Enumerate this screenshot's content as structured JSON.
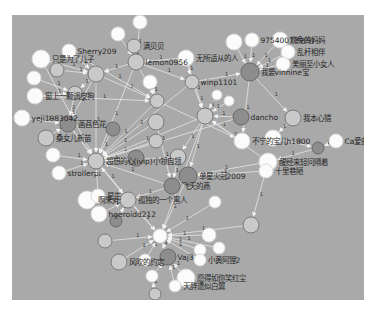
{
  "graph": {
    "type": "directed-network",
    "background": "#a9a9a9",
    "edge_color": "#e8e8e8",
    "node_colors": {
      "light": "#ffffff",
      "mid": "#c8c8c8",
      "dark": "#8c8c8c"
    },
    "nodes": [
      {
        "id": "n1",
        "x": 140,
        "y": 22,
        "r": 7,
        "tone": "light",
        "label": ""
      },
      {
        "id": "n2",
        "x": 118,
        "y": 34,
        "r": 7,
        "tone": "light",
        "label": ""
      },
      {
        "id": "n3",
        "x": 134,
        "y": 46,
        "r": 7,
        "tone": "mid",
        "label": "满贝贝"
      },
      {
        "id": "n4",
        "x": 69,
        "y": 51,
        "r": 7,
        "tone": "light",
        "label": "Sherry209"
      },
      {
        "id": "n5",
        "x": 41,
        "y": 59,
        "r": 9,
        "tone": "light",
        "label": "只是为了儿子"
      },
      {
        "id": "n6",
        "x": 57,
        "y": 70,
        "r": 7,
        "tone": "mid",
        "label": ""
      },
      {
        "id": "n7",
        "x": 96,
        "y": 74,
        "r": 8,
        "tone": "mid",
        "label": ""
      },
      {
        "id": "n8",
        "x": 136,
        "y": 62,
        "r": 8,
        "tone": "mid",
        "label": "lemon0956"
      },
      {
        "id": "n9",
        "x": 186,
        "y": 58,
        "r": 8,
        "tone": "light",
        "label": "无所适从的人"
      },
      {
        "id": "n10",
        "x": 34,
        "y": 78,
        "r": 7,
        "tone": "light",
        "label": ""
      },
      {
        "id": "n11",
        "x": 75,
        "y": 93,
        "r": 7,
        "tone": "mid",
        "label": ""
      },
      {
        "id": "n12",
        "x": 35,
        "y": 96,
        "r": 8,
        "tone": "light",
        "label": "窗上一颗调皮狗"
      },
      {
        "id": "n13",
        "x": 150,
        "y": 82,
        "r": 7,
        "tone": "light",
        "label": ""
      },
      {
        "id": "n14",
        "x": 157,
        "y": 101,
        "r": 7,
        "tone": "mid",
        "label": ""
      },
      {
        "id": "n15",
        "x": 22,
        "y": 118,
        "r": 8,
        "tone": "light",
        "label": "yeji1983042"
      },
      {
        "id": "n16",
        "x": 68,
        "y": 124,
        "r": 8,
        "tone": "dark",
        "label": "菡萏色花"
      },
      {
        "id": "n17",
        "x": 113,
        "y": 129,
        "r": 7,
        "tone": "dark",
        "label": ""
      },
      {
        "id": "n18",
        "x": 46,
        "y": 138,
        "r": 8,
        "tone": "mid",
        "label": "桑女儿新苗"
      },
      {
        "id": "n19",
        "x": 156,
        "y": 122,
        "r": 8,
        "tone": "mid",
        "label": ""
      },
      {
        "id": "n20",
        "x": 156,
        "y": 141,
        "r": 7,
        "tone": "mid",
        "label": ""
      },
      {
        "id": "n21",
        "x": 53,
        "y": 155,
        "r": 7,
        "tone": "light",
        "label": ""
      },
      {
        "id": "n22",
        "x": 96,
        "y": 161,
        "r": 8,
        "tone": "mid",
        "label": "超想的心(ivip)小领自领"
      },
      {
        "id": "n23",
        "x": 136,
        "y": 158,
        "r": 8,
        "tone": "dark",
        "label": ""
      },
      {
        "id": "n24",
        "x": 178,
        "y": 157,
        "r": 8,
        "tone": "mid",
        "label": ""
      },
      {
        "id": "n25",
        "x": 59,
        "y": 173,
        "r": 7,
        "tone": "light",
        "label": "strollerp"
      },
      {
        "id": "n26",
        "x": 192,
        "y": 82,
        "r": 7,
        "tone": "mid",
        "label": "winp1101"
      },
      {
        "id": "n27",
        "x": 217,
        "y": 95,
        "r": 5,
        "tone": "light",
        "label": ""
      },
      {
        "id": "n28",
        "x": 229,
        "y": 101,
        "r": 5,
        "tone": "light",
        "label": ""
      },
      {
        "id": "n29",
        "x": 234,
        "y": 42,
        "r": 8,
        "tone": "light",
        "label": ""
      },
      {
        "id": "n30",
        "x": 252,
        "y": 40,
        "r": 7,
        "tone": "light",
        "label": "975400739(9)"
      },
      {
        "id": "n31",
        "x": 280,
        "y": 40,
        "r": 8,
        "tone": "light",
        "label": "烧免的妈妈"
      },
      {
        "id": "n32",
        "x": 288,
        "y": 52,
        "r": 7,
        "tone": "light",
        "label": "乱杆相伴"
      },
      {
        "id": "n33",
        "x": 283,
        "y": 64,
        "r": 7,
        "tone": "light",
        "label": "美丽至小女人"
      },
      {
        "id": "n34",
        "x": 250,
        "y": 72,
        "r": 9,
        "tone": "dark",
        "label": "我要vinnine宝"
      },
      {
        "id": "n35",
        "x": 205,
        "y": 116,
        "r": 8,
        "tone": "mid",
        "label": ""
      },
      {
        "id": "n36",
        "x": 241,
        "y": 117,
        "r": 8,
        "tone": "dark",
        "label": "dancho"
      },
      {
        "id": "n37",
        "x": 293,
        "y": 118,
        "r": 8,
        "tone": "mid",
        "label": "我本心猎"
      },
      {
        "id": "n38",
        "x": 242,
        "y": 141,
        "r": 8,
        "tone": "light",
        "label": "不宁的宝儿h1800"
      },
      {
        "id": "n39",
        "x": 273,
        "y": 138,
        "r": 8,
        "tone": "light",
        "label": ""
      },
      {
        "id": "n40",
        "x": 318,
        "y": 148,
        "r": 6,
        "tone": "dark",
        "label": ""
      },
      {
        "id": "n41",
        "x": 336,
        "y": 141,
        "r": 7,
        "tone": "light",
        "label": "Ca爱曲"
      },
      {
        "id": "n42",
        "x": 268,
        "y": 162,
        "r": 9,
        "tone": "light",
        "label": "醒经来轻问隔着"
      },
      {
        "id": "n43",
        "x": 266,
        "y": 171,
        "r": 7,
        "tone": "light",
        "label": "十里巷陋"
      },
      {
        "id": "n44",
        "x": 188,
        "y": 176,
        "r": 9,
        "tone": "dark",
        "label": "单星火冠2009"
      },
      {
        "id": "n45",
        "x": 172,
        "y": 186,
        "r": 8,
        "tone": "dark",
        "label": "飞天的燕"
      },
      {
        "id": "n46",
        "x": 215,
        "y": 202,
        "r": 6,
        "tone": "light",
        "label": ""
      },
      {
        "id": "n47",
        "x": 87,
        "y": 200,
        "r": 9,
        "tone": "light",
        "label": "啊朱丸"
      },
      {
        "id": "n48",
        "x": 98,
        "y": 196,
        "r": 7,
        "tone": "light",
        "label": "星生"
      },
      {
        "id": "n49",
        "x": 128,
        "y": 200,
        "r": 8,
        "tone": "mid",
        "label": "孤独的一个黑人"
      },
      {
        "id": "n50",
        "x": 99,
        "y": 214,
        "r": 8,
        "tone": "light",
        "label": "hgeroidd212"
      },
      {
        "id": "n51",
        "x": 116,
        "y": 221,
        "r": 6,
        "tone": "dark",
        "label": ""
      },
      {
        "id": "n52",
        "x": 160,
        "y": 236,
        "r": 7,
        "tone": "light",
        "label": ""
      },
      {
        "id": "n53",
        "x": 251,
        "y": 225,
        "r": 8,
        "tone": "mid",
        "label": ""
      },
      {
        "id": "n54",
        "x": 105,
        "y": 241,
        "r": 7,
        "tone": "mid",
        "label": ""
      },
      {
        "id": "n55",
        "x": 209,
        "y": 235,
        "r": 7,
        "tone": "light",
        "label": ""
      },
      {
        "id": "n56",
        "x": 219,
        "y": 248,
        "r": 6,
        "tone": "light",
        "label": ""
      },
      {
        "id": "n57",
        "x": 200,
        "y": 250,
        "r": 6,
        "tone": "light",
        "label": ""
      },
      {
        "id": "n58",
        "x": 119,
        "y": 262,
        "r": 8,
        "tone": "mid",
        "label": "风吹的约定"
      },
      {
        "id": "n59",
        "x": 145,
        "y": 260,
        "r": 6,
        "tone": "light",
        "label": ""
      },
      {
        "id": "n60",
        "x": 168,
        "y": 257,
        "r": 8,
        "tone": "dark",
        "label": "Vaj3"
      },
      {
        "id": "n61",
        "x": 200,
        "y": 260,
        "r": 6,
        "tone": "light",
        "label": "小黄阿狸2"
      },
      {
        "id": "n62",
        "x": 152,
        "y": 276,
        "r": 6,
        "tone": "light",
        "label": ""
      },
      {
        "id": "n63",
        "x": 186,
        "y": 278,
        "r": 9,
        "tone": "light",
        "label": "愿得如你笑红尘"
      },
      {
        "id": "n64",
        "x": 175,
        "y": 286,
        "r": 6,
        "tone": "light",
        "label": "天辞遗似白翼"
      },
      {
        "id": "n65",
        "x": 155,
        "y": 294,
        "r": 6,
        "tone": "mid",
        "label": ""
      }
    ],
    "edges": [
      [
        "n1",
        "n8"
      ],
      [
        "n2",
        "n8"
      ],
      [
        "n3",
        "n8"
      ],
      [
        "n4",
        "n7"
      ],
      [
        "n5",
        "n7"
      ],
      [
        "n6",
        "n7"
      ],
      [
        "n8",
        "n7"
      ],
      [
        "n9",
        "n8"
      ],
      [
        "n10",
        "n11"
      ],
      [
        "n12",
        "n11"
      ],
      [
        "n7",
        "n11"
      ],
      [
        "n7",
        "n16"
      ],
      [
        "n11",
        "n16"
      ],
      [
        "n15",
        "n16"
      ],
      [
        "n18",
        "n16"
      ],
      [
        "n13",
        "n14"
      ],
      [
        "n8",
        "n14"
      ],
      [
        "n7",
        "n14"
      ],
      [
        "n14",
        "n22"
      ],
      [
        "n16",
        "n22"
      ],
      [
        "n21",
        "n22"
      ],
      [
        "n25",
        "n22"
      ],
      [
        "n7",
        "n22"
      ],
      [
        "n17",
        "n22"
      ],
      [
        "n20",
        "n22"
      ],
      [
        "n19",
        "n22"
      ],
      [
        "n23",
        "n22"
      ],
      [
        "n8",
        "n22"
      ],
      [
        "n24",
        "n22"
      ],
      [
        "n26",
        "n35"
      ],
      [
        "n27",
        "n35"
      ],
      [
        "n28",
        "n35"
      ],
      [
        "n36",
        "n35"
      ],
      [
        "n9",
        "n35"
      ],
      [
        "n35",
        "n22"
      ],
      [
        "n35",
        "n24"
      ],
      [
        "n29",
        "n34"
      ],
      [
        "n30",
        "n34"
      ],
      [
        "n31",
        "n34"
      ],
      [
        "n32",
        "n34"
      ],
      [
        "n33",
        "n34"
      ],
      [
        "n26",
        "n34"
      ],
      [
        "n34",
        "n37"
      ],
      [
        "n34",
        "n38"
      ],
      [
        "n37",
        "n39"
      ],
      [
        "n39",
        "n40"
      ],
      [
        "n41",
        "n40"
      ],
      [
        "n40",
        "n42"
      ],
      [
        "n42",
        "n44"
      ],
      [
        "n43",
        "n44"
      ],
      [
        "n42",
        "n53"
      ],
      [
        "n38",
        "n35"
      ],
      [
        "n35",
        "n44"
      ],
      [
        "n44",
        "n45"
      ],
      [
        "n45",
        "n22"
      ],
      [
        "n45",
        "n49"
      ],
      [
        "n49",
        "n22"
      ],
      [
        "n48",
        "n22"
      ],
      [
        "n47",
        "n48"
      ],
      [
        "n50",
        "n49"
      ],
      [
        "n51",
        "n49"
      ],
      [
        "n49",
        "n52"
      ],
      [
        "n22",
        "n52"
      ],
      [
        "n35",
        "n52"
      ],
      [
        "n44",
        "n52"
      ],
      [
        "n46",
        "n52"
      ],
      [
        "n53",
        "n52"
      ],
      [
        "n54",
        "n52"
      ],
      [
        "n55",
        "n52"
      ],
      [
        "n56",
        "n52"
      ],
      [
        "n57",
        "n52"
      ],
      [
        "n58",
        "n52"
      ],
      [
        "n59",
        "n52"
      ],
      [
        "n60",
        "n52"
      ],
      [
        "n61",
        "n52"
      ],
      [
        "n62",
        "n60"
      ],
      [
        "n63",
        "n60"
      ],
      [
        "n64",
        "n60"
      ],
      [
        "n65",
        "n62"
      ],
      [
        "n14",
        "n38"
      ],
      [
        "n26",
        "n22"
      ],
      [
        "n9",
        "n26"
      ],
      [
        "n36",
        "n22"
      ],
      [
        "n19",
        "n45"
      ],
      [
        "n24",
        "n45"
      ],
      [
        "n16",
        "n49"
      ],
      [
        "n12",
        "n14"
      ],
      [
        "n5",
        "n22"
      ],
      [
        "n4",
        "n14"
      ],
      [
        "n8",
        "n26"
      ],
      [
        "n42",
        "n35"
      ]
    ]
  }
}
